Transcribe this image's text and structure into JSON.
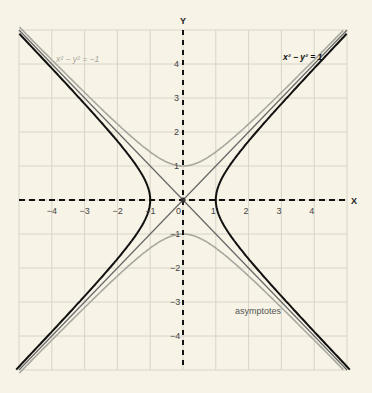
{
  "figure": {
    "axes": {
      "x_label": "X",
      "y_label": "Y"
    },
    "labels": {
      "hyperbola_main": "x² − y² = 1",
      "hyperbola_conjugate": "x² − y² = −1",
      "asymptotes": "asymptotes"
    },
    "colors": {
      "background": "#f7f3e6",
      "grid": "#d8d4c8",
      "axes": "#111111",
      "hyperbola_main": "#111111",
      "hyperbola_conjugate": "#a8a8a0",
      "asymptotes": "#666666"
    },
    "x_ticks": [
      "-4",
      "-3",
      "-2",
      "-1",
      "0",
      "1",
      "2",
      "3",
      "4"
    ],
    "y_ticks": [
      "4",
      "3",
      "2",
      "1",
      "-1",
      "-2",
      "-3",
      "-4"
    ]
  },
  "chart_data": {
    "type": "line",
    "title": "",
    "xlabel": "X",
    "ylabel": "Y",
    "xlim": [
      -5,
      5
    ],
    "ylim": [
      -5,
      5
    ],
    "grid": true,
    "series": [
      {
        "name": "x² − y² = 1",
        "equation": "x^2 - y^2 = 1",
        "style": "black, bold"
      },
      {
        "name": "x² − y² = −1",
        "equation": "x^2 - y^2 = -1",
        "style": "light gray"
      },
      {
        "name": "asymptotes",
        "equation": "y = ±x",
        "style": "gray thin"
      }
    ],
    "x_tick_labels": [
      "-4",
      "-3",
      "-2",
      "-1",
      "0",
      "1",
      "2",
      "3",
      "4"
    ],
    "y_tick_labels": [
      "-4",
      "-3",
      "-2",
      "-1",
      "1",
      "2",
      "3",
      "4"
    ]
  }
}
